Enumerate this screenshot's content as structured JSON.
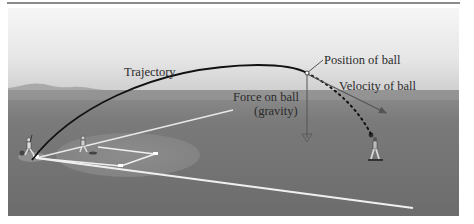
{
  "figure": {
    "labels": {
      "trajectory": "Trajectory",
      "position": "Position of ball",
      "velocity": "Velocity of ball",
      "force_line1": "Force on ball",
      "force_line2": "(gravity)"
    },
    "colors": {
      "sky_top": "#f4f4f4",
      "sky_bottom": "#d6d6d6",
      "field": "#767676",
      "infield_dirt": "#9a9a9a",
      "trajectory": "#111111",
      "chalk": "#f2f2f2",
      "text": "#2a2a2a"
    },
    "scene": "Baseball field: batter at home plate hits ball; trajectory arc rises and falls toward an outfielder"
  }
}
